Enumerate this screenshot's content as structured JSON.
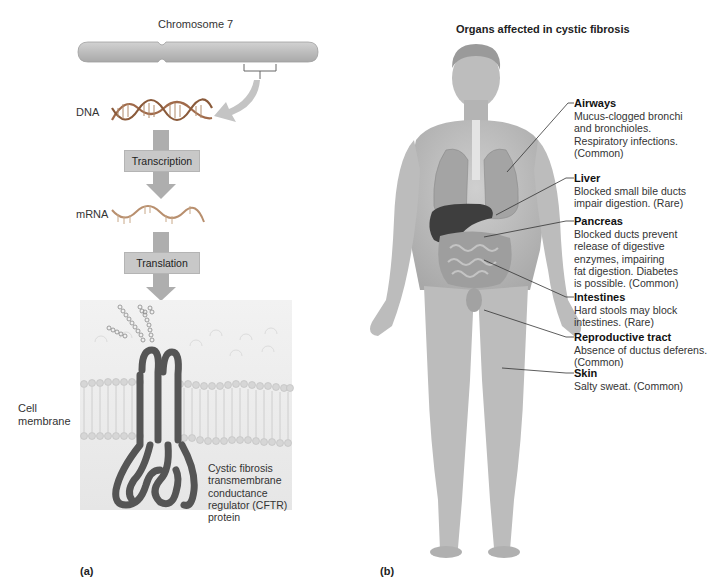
{
  "panel_a": {
    "label": "(a)",
    "chromosome_label": "Chromosome 7",
    "dna_label": "DNA",
    "mrna_label": "mRNA",
    "steps": [
      {
        "label": "Transcription"
      },
      {
        "label": "Translation"
      }
    ],
    "membrane_label_line1": "Cell",
    "membrane_label_line2": "membrane",
    "protein_label_lines": [
      "Cystic fibrosis",
      "transmembrane",
      "conductance",
      "regulator (CFTR)",
      "protein"
    ]
  },
  "panel_b": {
    "label": "(b)",
    "title": "Organs affected in cystic fibrosis",
    "organs": [
      {
        "name": "Airways",
        "desc_lines": [
          "Mucus-clogged bronchi",
          "and bronchioles.",
          "Respiratory infections.",
          "(Common)"
        ]
      },
      {
        "name": "Liver",
        "desc_lines": [
          "Blocked small bile ducts",
          "impair digestion. (Rare)"
        ]
      },
      {
        "name": "Pancreas",
        "desc_lines": [
          "Blocked ducts prevent",
          "release of digestive",
          "enzymes, impairing",
          "fat digestion. Diabetes",
          "is possible. (Common)"
        ]
      },
      {
        "name": "Intestines",
        "desc_lines": [
          "Hard stools may block",
          "intestines. (Rare)"
        ]
      },
      {
        "name": "Reproductive tract",
        "desc_lines": [
          "Absence of ductus deferens.",
          "(Common)"
        ]
      },
      {
        "name": "Skin",
        "desc_lines": [
          "Salty sweat. (Common)"
        ]
      }
    ]
  },
  "colors": {
    "chromosome": "#b9b9b9",
    "arrow": "#a9a9a9",
    "protein": "#5a5a5a",
    "skin": "#bdbdbd",
    "membrane_bg": "#ececec"
  }
}
